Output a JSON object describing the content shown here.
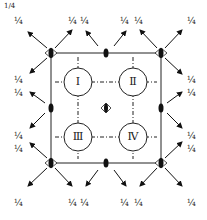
{
  "diagram": {
    "top_mark": "1/4",
    "regions": [
      "Ⅰ",
      "Ⅱ",
      "Ⅲ",
      "Ⅳ"
    ],
    "fraction_label": "¼",
    "labels": [
      {
        "id": "l1",
        "text": "¼",
        "x": 14,
        "y": 17
      },
      {
        "id": "l2",
        "text": "¼",
        "x": 68,
        "y": 17
      },
      {
        "id": "l3",
        "text": "¼",
        "x": 80,
        "y": 17
      },
      {
        "id": "l4",
        "text": "¼",
        "x": 120,
        "y": 17
      },
      {
        "id": "l5",
        "text": "¼",
        "x": 134,
        "y": 17
      },
      {
        "id": "l6",
        "text": "¼",
        "x": 187,
        "y": 17
      },
      {
        "id": "l7",
        "text": "¼",
        "x": 14,
        "y": 76
      },
      {
        "id": "l8",
        "text": "¼",
        "x": 14,
        "y": 89
      },
      {
        "id": "l9",
        "text": "¼",
        "x": 187,
        "y": 76
      },
      {
        "id": "l10",
        "text": "¼",
        "x": 187,
        "y": 89
      },
      {
        "id": "l11",
        "text": "¼",
        "x": 14,
        "y": 132
      },
      {
        "id": "l12",
        "text": "¼",
        "x": 14,
        "y": 145
      },
      {
        "id": "l13",
        "text": "¼",
        "x": 187,
        "y": 132
      },
      {
        "id": "l14",
        "text": "¼",
        "x": 187,
        "y": 145
      },
      {
        "id": "l15",
        "text": "¼",
        "x": 14,
        "y": 199
      },
      {
        "id": "l16",
        "text": "¼",
        "x": 68,
        "y": 199
      },
      {
        "id": "l17",
        "text": "¼",
        "x": 80,
        "y": 199
      },
      {
        "id": "l18",
        "text": "¼",
        "x": 120,
        "y": 199
      },
      {
        "id": "l19",
        "text": "¼",
        "x": 134,
        "y": 199
      },
      {
        "id": "l20",
        "text": "¼",
        "x": 187,
        "y": 199
      }
    ]
  }
}
